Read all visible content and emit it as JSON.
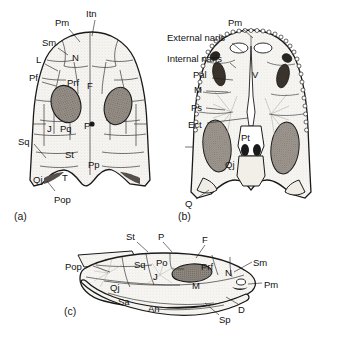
{
  "figure": {
    "background_color": "#ffffff",
    "ink_color": "#1a1a1a",
    "orbit_fill": "#8c8c8c",
    "bone_fill": "#f4f2ee"
  },
  "panels": [
    {
      "id": "a",
      "caption": "(a)",
      "view": "dorsal",
      "caption_x": 14,
      "caption_y": 210,
      "labels": [
        {
          "text": "Pm",
          "x": 55,
          "y": 18,
          "lx1": 69,
          "ly1": 29,
          "lx2": 80,
          "ly2": 40
        },
        {
          "text": "Itn",
          "x": 86,
          "y": 9,
          "lx1": 95,
          "ly1": 20,
          "lx2": 92,
          "ly2": 35
        },
        {
          "text": "Sm",
          "x": 42,
          "y": 38,
          "lx1": 57,
          "ly1": 48,
          "lx2": 66,
          "ly2": 54
        },
        {
          "text": "L",
          "x": 36,
          "y": 55,
          "lx1": 44,
          "ly1": 64,
          "lx2": 57,
          "ly2": 70
        },
        {
          "text": "Pf",
          "x": 29,
          "y": 73,
          "lx1": 41,
          "ly1": 82,
          "lx2": 55,
          "ly2": 85
        },
        {
          "text": "N",
          "x": 72,
          "y": 53,
          "lx1": null,
          "ly1": null,
          "lx2": null,
          "ly2": null
        },
        {
          "text": "Prf",
          "x": 67,
          "y": 78,
          "lx1": null,
          "ly1": null,
          "lx2": null,
          "ly2": null
        },
        {
          "text": "F",
          "x": 87,
          "y": 81,
          "lx1": null,
          "ly1": null,
          "lx2": null,
          "ly2": null
        },
        {
          "text": "J",
          "x": 47,
          "y": 124,
          "lx1": null,
          "ly1": null,
          "lx2": null,
          "ly2": null
        },
        {
          "text": "Pq",
          "x": 60,
          "y": 124,
          "lx1": null,
          "ly1": null,
          "lx2": null,
          "ly2": null
        },
        {
          "text": "P",
          "x": 84,
          "y": 121,
          "lx1": null,
          "ly1": null,
          "lx2": null,
          "ly2": null
        },
        {
          "text": "Sq",
          "x": 18,
          "y": 137,
          "lx1": 34,
          "ly1": 144,
          "lx2": 45,
          "ly2": 158
        },
        {
          "text": "St",
          "x": 65,
          "y": 150,
          "lx1": null,
          "ly1": null,
          "lx2": null,
          "ly2": null
        },
        {
          "text": "Pp",
          "x": 88,
          "y": 160,
          "lx1": null,
          "ly1": null,
          "lx2": null,
          "ly2": null
        },
        {
          "text": "T",
          "x": 62,
          "y": 173,
          "lx1": null,
          "ly1": null,
          "lx2": null,
          "ly2": null
        },
        {
          "text": "Qj",
          "x": 33,
          "y": 175,
          "lx1": null,
          "ly1": null,
          "lx2": null,
          "ly2": null
        },
        {
          "text": "Pop",
          "x": 54,
          "y": 195,
          "lx1": 55,
          "ly1": 194,
          "lx2": 47,
          "ly2": 183
        }
      ]
    },
    {
      "id": "b",
      "caption": "(b)",
      "view": "palatal",
      "caption_x": 178,
      "caption_y": 210,
      "labels": [
        {
          "text": "Pm",
          "x": 228,
          "y": 18,
          "lx1": 243,
          "ly1": 29,
          "lx2": 252,
          "ly2": 38
        },
        {
          "text": "External naris",
          "x": 167,
          "y": 33,
          "lx1": 232,
          "ly1": 43,
          "lx2": 244,
          "ly2": 53
        },
        {
          "text": "Internal naris",
          "x": 167,
          "y": 54,
          "lx1": 230,
          "ly1": 63,
          "lx2": 236,
          "ly2": 68
        },
        {
          "text": "Pal",
          "x": 193,
          "y": 70,
          "lx1": 212,
          "ly1": 78,
          "lx2": 233,
          "ly2": 80
        },
        {
          "text": "M",
          "x": 194,
          "y": 85,
          "lx1": 206,
          "ly1": 91,
          "lx2": 228,
          "ly2": 92
        },
        {
          "text": "Ps",
          "x": 191,
          "y": 103,
          "lx1": 206,
          "ly1": 108,
          "lx2": 225,
          "ly2": 110
        },
        {
          "text": "Ect",
          "x": 188,
          "y": 120,
          "lx1": 207,
          "ly1": 123,
          "lx2": 248,
          "ly2": 118
        },
        {
          "text": "V",
          "x": 252,
          "y": 70,
          "lx1": null,
          "ly1": null,
          "lx2": null,
          "ly2": null
        },
        {
          "text": "Pt",
          "x": 241,
          "y": 133,
          "lx1": null,
          "ly1": null,
          "lx2": null,
          "ly2": null
        },
        {
          "text": "Qj",
          "x": 225,
          "y": 160,
          "lx1": null,
          "ly1": null,
          "lx2": null,
          "ly2": null
        },
        {
          "text": "Q",
          "x": 185,
          "y": 199,
          "lx1": 196,
          "ly1": 199,
          "lx2": 209,
          "ly2": 190
        }
      ]
    },
    {
      "id": "c",
      "caption": "(c)",
      "view": "lateral",
      "caption_x": 64,
      "caption_y": 305,
      "labels": [
        {
          "text": "St",
          "x": 126,
          "y": 232,
          "lx1": 137,
          "ly1": 242,
          "lx2": 148,
          "ly2": 252
        },
        {
          "text": "P",
          "x": 158,
          "y": 232,
          "lx1": 163,
          "ly1": 242,
          "lx2": 172,
          "ly2": 252
        },
        {
          "text": "F",
          "x": 202,
          "y": 235,
          "lx1": 205,
          "ly1": 245,
          "lx2": 196,
          "ly2": 258
        },
        {
          "text": "Pop",
          "x": 65,
          "y": 262,
          "lx1": 93,
          "ly1": 266,
          "lx2": 110,
          "ly2": 272
        },
        {
          "text": "Sq",
          "x": 134,
          "y": 260,
          "lx1": null,
          "ly1": null,
          "lx2": null,
          "ly2": null
        },
        {
          "text": "Po",
          "x": 156,
          "y": 258,
          "lx1": null,
          "ly1": null,
          "lx2": null,
          "ly2": null
        },
        {
          "text": "Prf",
          "x": 201,
          "y": 262,
          "lx1": null,
          "ly1": null,
          "lx2": null,
          "ly2": null
        },
        {
          "text": "N",
          "x": 225,
          "y": 268,
          "lx1": null,
          "ly1": null,
          "lx2": null,
          "ly2": null
        },
        {
          "text": "Sm",
          "x": 253,
          "y": 258,
          "lx1": 252,
          "ly1": 262,
          "lx2": 234,
          "ly2": 272
        },
        {
          "text": "J",
          "x": 153,
          "y": 272,
          "lx1": null,
          "ly1": null,
          "lx2": null,
          "ly2": null
        },
        {
          "text": "Qj",
          "x": 110,
          "y": 283,
          "lx1": null,
          "ly1": null,
          "lx2": null,
          "ly2": null
        },
        {
          "text": "M",
          "x": 192,
          "y": 281,
          "lx1": null,
          "ly1": null,
          "lx2": null,
          "ly2": null
        },
        {
          "text": "Pm",
          "x": 264,
          "y": 280,
          "lx1": 262,
          "ly1": 283,
          "lx2": 248,
          "ly2": 284
        },
        {
          "text": "Sa",
          "x": 118,
          "y": 297,
          "lx1": null,
          "ly1": null,
          "lx2": null,
          "ly2": null
        },
        {
          "text": "An",
          "x": 148,
          "y": 304,
          "lx1": null,
          "ly1": null,
          "lx2": null,
          "ly2": null
        },
        {
          "text": "D",
          "x": 238,
          "y": 305,
          "lx1": 238,
          "ly1": 304,
          "lx2": 226,
          "ly2": 297
        },
        {
          "text": "Sp",
          "x": 219,
          "y": 315,
          "lx1": 219,
          "ly1": 313,
          "lx2": 205,
          "ly2": 303
        }
      ]
    }
  ],
  "abbreviations": [
    "Pm",
    "Itn",
    "Sm",
    "L",
    "Pf",
    "N",
    "Prf",
    "F",
    "J",
    "Pq",
    "P",
    "Sq",
    "St",
    "Pp",
    "T",
    "Qj",
    "Pop",
    "External naris",
    "Internal naris",
    "Pal",
    "M",
    "Ps",
    "Ect",
    "V",
    "Pt",
    "Q",
    "Po",
    "Sa",
    "An",
    "D",
    "Sp"
  ]
}
